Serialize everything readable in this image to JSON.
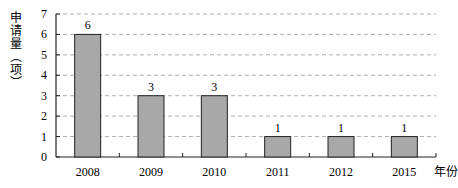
{
  "chart_data": {
    "type": "bar",
    "title": "",
    "xlabel": "年份",
    "ylabel": "申请量（项）",
    "categories": [
      "2008",
      "2009",
      "2010",
      "2011",
      "2012",
      "2015"
    ],
    "values": [
      6,
      3,
      3,
      1,
      1,
      1
    ],
    "ylim": [
      0,
      7
    ],
    "yticks": [
      0,
      1,
      2,
      3,
      4,
      5,
      6,
      7
    ],
    "grid": "dashed horizontal",
    "bar_color": "#a8a8a8"
  }
}
